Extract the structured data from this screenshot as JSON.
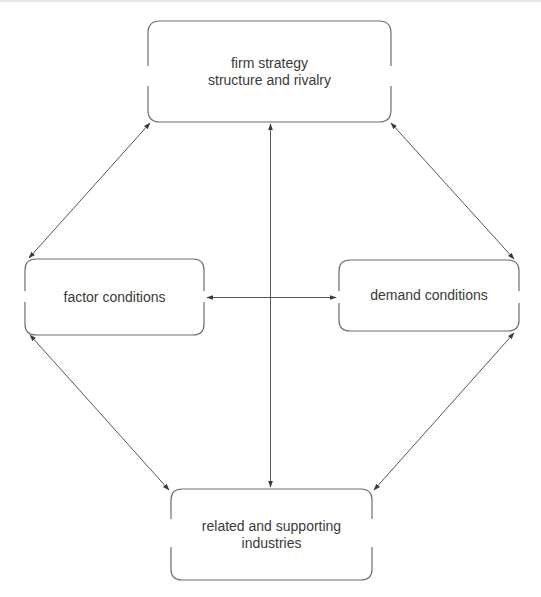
{
  "diagram": {
    "title": "",
    "nodes": [
      {
        "id": "firm",
        "lines": [
          "firm strategy",
          "structure and rivalry"
        ],
        "box": {
          "x": 148,
          "y": 21,
          "w": 243,
          "h": 101
        }
      },
      {
        "id": "factor",
        "lines": [
          "factor conditions"
        ],
        "box": {
          "x": 25,
          "y": 259,
          "w": 179,
          "h": 76
        }
      },
      {
        "id": "demand",
        "lines": [
          "demand conditions"
        ],
        "box": {
          "x": 339,
          "y": 260,
          "w": 180,
          "h": 71
        }
      },
      {
        "id": "related",
        "lines": [
          "related and supporting",
          "industries"
        ],
        "box": {
          "x": 171,
          "y": 489,
          "w": 201,
          "h": 91
        }
      }
    ],
    "edges": [
      {
        "from": "firm",
        "to": "factor",
        "bidirectional": true
      },
      {
        "from": "firm",
        "to": "demand",
        "bidirectional": true
      },
      {
        "from": "firm",
        "to": "related",
        "bidirectional": true
      },
      {
        "from": "factor",
        "to": "demand",
        "bidirectional": true
      },
      {
        "from": "factor",
        "to": "related",
        "bidirectional": true
      },
      {
        "from": "demand",
        "to": "related",
        "bidirectional": true
      }
    ],
    "colors": {
      "stroke": "#6e6e6e",
      "text": "#3a3a3a",
      "background": "#ffffff"
    }
  }
}
